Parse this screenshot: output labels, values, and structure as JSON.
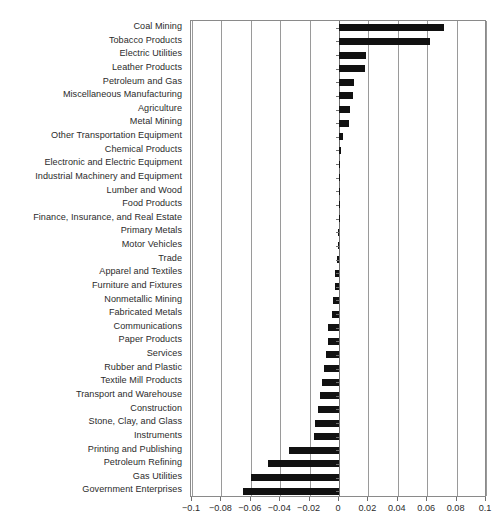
{
  "chart_data": {
    "type": "bar",
    "orientation": "horizontal",
    "title": "",
    "subtitle": "",
    "xlabel": "",
    "ylabel": "",
    "xlim": [
      -0.1,
      0.1
    ],
    "xticks": [
      -0.1,
      -0.08,
      -0.06,
      -0.04,
      -0.02,
      0,
      0.02,
      0.04,
      0.06,
      0.08,
      0.1
    ],
    "xtick_labels": [
      "-0.1",
      "-0.08",
      "-0.06",
      "-0.04",
      "-0.02",
      "0",
      "0.02",
      "0.04",
      "0.06",
      "0.08",
      "0.1"
    ],
    "grid": true,
    "grid_axis": "x",
    "legend": null,
    "bar_color": "#111111",
    "categories": [
      "Coal Mining",
      "Tobacco Products",
      "Electric Utilities",
      "Leather Products",
      "Petroleum and Gas",
      "Miscellaneous Manufacturing",
      "Agriculture",
      "Metal Mining",
      "Other Transportation Equipment",
      "Chemical Products",
      "Electronic and Electric Equipment",
      "Industrial Machinery and Equipment",
      "Lumber and Wood",
      "Food Products",
      "Finance, Insurance, and Real Estate",
      "Primary Metals",
      "Motor Vehicles",
      "Trade",
      "Apparel and Textiles",
      "Furniture and Fixtures",
      "Nonmetallic Mining",
      "Fabricated Metals",
      "Communications",
      "Paper Products",
      "Services",
      "Rubber and Plastic",
      "Textile Mill Products",
      "Transport and Warehouse",
      "Construction",
      "Stone, Clay, and Glass",
      "Instruments",
      "Printing and Publishing",
      "Petroleum Refining",
      "Gas Utilities",
      "Government Enterprises"
    ],
    "values": [
      0.0715,
      0.062,
      0.0185,
      0.018,
      0.0105,
      0.0095,
      0.0075,
      0.0068,
      0.0028,
      0.0012,
      0.0008,
      0.0006,
      0.0004,
      0.0002,
      0.0001,
      -0.0008,
      -0.001,
      -0.0015,
      -0.0025,
      -0.003,
      -0.0042,
      -0.0048,
      -0.0072,
      -0.0078,
      -0.009,
      -0.0105,
      -0.0118,
      -0.013,
      -0.0145,
      -0.016,
      -0.0168,
      -0.034,
      -0.0485,
      -0.06,
      -0.0655
    ]
  }
}
